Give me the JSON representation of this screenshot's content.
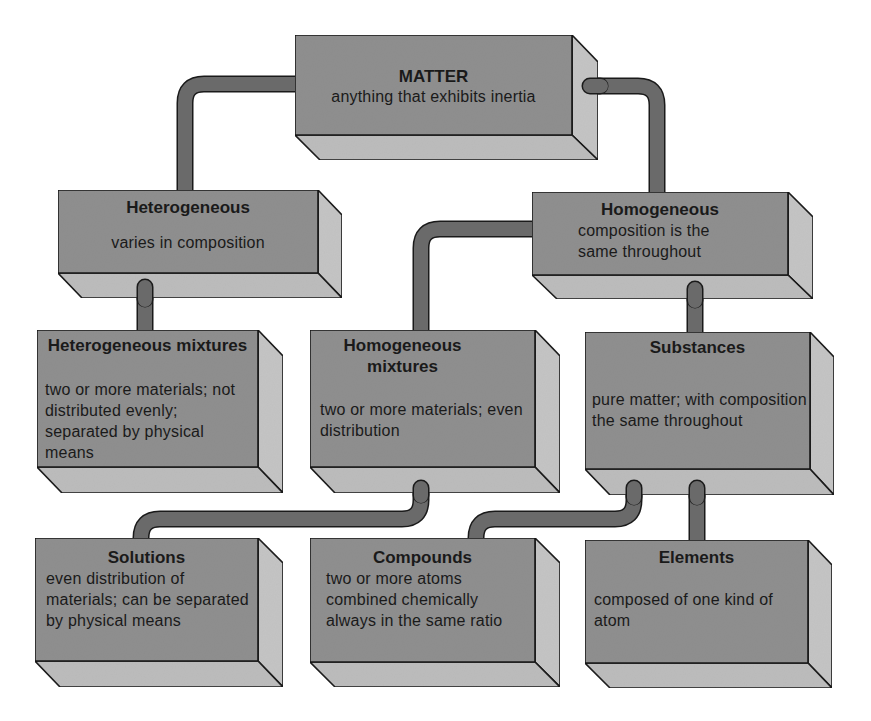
{
  "diagram": {
    "colors": {
      "front_face": "#8f8f8f",
      "side_face": "#c4c4c4",
      "bottom_face": "#bcbcbc",
      "connector": "#6a6a6a",
      "outline": "#1a1a1a",
      "background": "#ffffff"
    },
    "nodes": [
      {
        "id": "matter",
        "title": "MATTER",
        "description": "anything that exhibits inertia",
        "parent": null
      },
      {
        "id": "heterogeneous",
        "title": "Heterogeneous",
        "description": "varies in composition",
        "parent": "matter"
      },
      {
        "id": "homogeneous",
        "title": "Homogeneous",
        "description": "composition is the same throughout",
        "parent": "matter"
      },
      {
        "id": "heterogeneous-mixtures",
        "title": "Heterogeneous mixtures",
        "description": "two or more materials; not distributed evenly; separated by physical means",
        "parent": "heterogeneous"
      },
      {
        "id": "homogeneous-mixtures",
        "title": "Homogeneous mixtures",
        "description": "two or more materials; even distribution",
        "parent": "homogeneous"
      },
      {
        "id": "substances",
        "title": "Substances",
        "description": "pure matter; with composition the same throughout",
        "parent": "homogeneous"
      },
      {
        "id": "solutions",
        "title": "Solutions",
        "description": "even distribution of materials; can be separated by physical means",
        "parent": "homogeneous-mixtures"
      },
      {
        "id": "compounds",
        "title": "Compounds",
        "description": "two or more atoms combined chemically always in the same ratio",
        "parent": "substances"
      },
      {
        "id": "elements",
        "title": "Elements",
        "description": "composed of one kind of atom",
        "parent": "substances"
      }
    ],
    "edges": [
      {
        "from": "matter",
        "to": "heterogeneous"
      },
      {
        "from": "matter",
        "to": "homogeneous"
      },
      {
        "from": "heterogeneous",
        "to": "heterogeneous-mixtures"
      },
      {
        "from": "homogeneous",
        "to": "homogeneous-mixtures"
      },
      {
        "from": "homogeneous",
        "to": "substances"
      },
      {
        "from": "homogeneous-mixtures",
        "to": "solutions"
      },
      {
        "from": "substances",
        "to": "compounds"
      },
      {
        "from": "substances",
        "to": "elements"
      }
    ]
  }
}
